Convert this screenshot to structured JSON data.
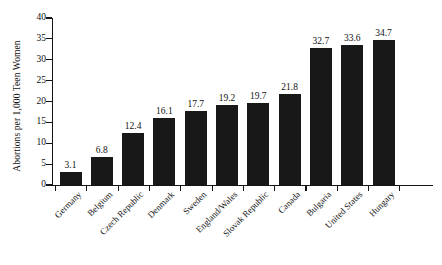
{
  "chart_data": {
    "type": "bar",
    "title": "",
    "xlabel": "",
    "ylabel": "Abortions per 1,000 Teen Women",
    "ylim": [
      0,
      40
    ],
    "ytick_step": 5,
    "yticks": [
      "40",
      "35",
      "30",
      "25",
      "20",
      "15",
      "10",
      "5",
      "0"
    ],
    "grid": false,
    "legend": "none",
    "bar_color": "#181818",
    "categories": [
      "Germany",
      "Belgium",
      "Czech Republic",
      "Denmark",
      "Sweden",
      "England/Wales",
      "Slovak Republic",
      "Canada",
      "Bulgaria",
      "United States",
      "Hungary"
    ],
    "values": [
      3.1,
      6.8,
      12.4,
      16.1,
      17.7,
      19.2,
      19.7,
      21.8,
      32.7,
      33.6,
      34.7
    ],
    "value_labels": [
      "3.1",
      "6.8",
      "12.4",
      "16.1",
      "17.7",
      "19.2",
      "19.7",
      "21.8",
      "32.7",
      "33.6",
      "34.7"
    ]
  }
}
